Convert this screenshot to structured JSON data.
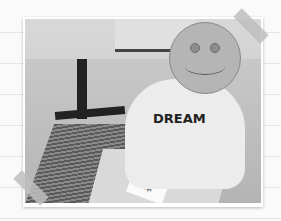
{
  "image": {
    "description": "Grayscale photo taped on lined paper: child in sweater at a table with a robotic arm device, face covered by smiley",
    "sweater_text": "DREAM",
    "overlay": "smiley-face",
    "colors": {
      "background": "#fafafa",
      "line": "#e6e6e6",
      "tape": "#bebebe",
      "smiley": "#b5b5b5"
    }
  }
}
